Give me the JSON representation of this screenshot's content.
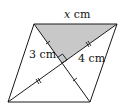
{
  "figure": {
    "type": "parallelogram-with-diagonals",
    "labels": {
      "top": {
        "var": "x",
        "unit": " cm"
      },
      "left_segment": "3 cm",
      "right_segment": "4 cm"
    },
    "vertices": {
      "top_left": [
        34,
        24
      ],
      "top_right": [
        117,
        24
      ],
      "bottom_right": [
        90,
        102
      ],
      "bottom_left": [
        8,
        102
      ],
      "intersection": [
        62,
        63
      ]
    },
    "shaded_region": "triangle top_left-top_right-intersection",
    "right_angle_at": "intersection",
    "colors": {
      "stroke": "#1a1a1a",
      "shade": "#c8c8c8",
      "background": "#ffffff"
    }
  }
}
